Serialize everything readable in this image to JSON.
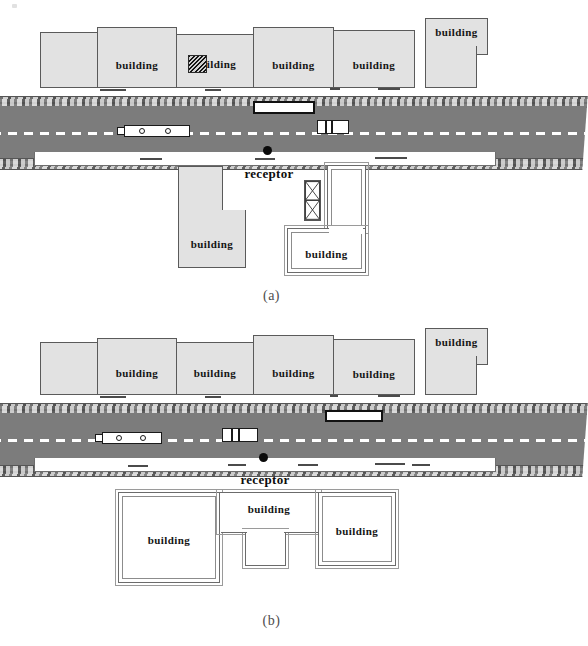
{
  "figure": {
    "stray_mark_top_left": "·"
  },
  "panels": [
    {
      "id": "a",
      "caption": "(a)",
      "receptor": {
        "label": "receptor"
      },
      "upper_buildings": [
        {
          "label": ""
        },
        {
          "label": "building"
        },
        {
          "label": "building",
          "smudged": true
        },
        {
          "label": "building"
        },
        {
          "label": "building"
        },
        {
          "label": "building"
        }
      ],
      "lower_buildings": [
        {
          "label": "building",
          "style": "gray-L"
        },
        {
          "label": "building",
          "style": "white-L"
        }
      ],
      "vehicles": [
        {
          "name": "bus-upper-lane",
          "type": "block"
        },
        {
          "name": "bus-lower-lane",
          "type": "bus",
          "wheels": 2
        },
        {
          "name": "truck-lower-lane",
          "type": "truck",
          "segments": 3
        }
      ]
    },
    {
      "id": "b",
      "caption": "(b)",
      "receptor": {
        "label": "receptor"
      },
      "upper_buildings": [
        {
          "label": ""
        },
        {
          "label": "building"
        },
        {
          "label": "building"
        },
        {
          "label": "building"
        },
        {
          "label": "building"
        },
        {
          "label": "building"
        }
      ],
      "lower_buildings": [
        {
          "label": "building",
          "style": "white-square"
        },
        {
          "label": "building",
          "style": "white-T"
        },
        {
          "label": "building",
          "style": "white-square"
        }
      ],
      "vehicles": [
        {
          "name": "bus-upper-lane",
          "type": "block"
        },
        {
          "name": "bus-lower-lane",
          "type": "bus",
          "wheels": 2
        },
        {
          "name": "truck-lower-lane",
          "type": "truck",
          "segments": 3
        }
      ]
    }
  ],
  "colors": {
    "road": "#7c7c7c",
    "building_fill_gray": "#e2e2e2",
    "building_fill_white": "#ffffff",
    "outline": "#5a5a5a",
    "centerline": "#ffffff",
    "receptor": "#0a0a0a",
    "caption": "#4d4d4d"
  }
}
